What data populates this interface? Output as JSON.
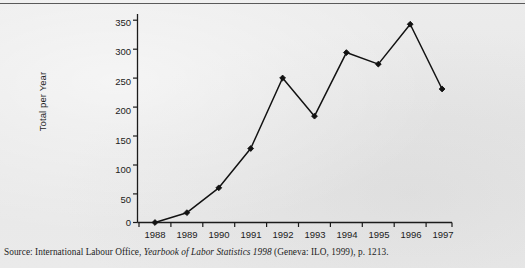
{
  "figure": {
    "source_prefix": "Source: International Labour Office, ",
    "source_italic": "Yearbook of Labor Statistics 1998",
    "source_suffix": " (Geneva: ILO, 1999), p. 1213."
  },
  "chart_data": {
    "type": "line",
    "title": "",
    "xlabel": "",
    "ylabel": "Total per Year",
    "categories": [
      "1988",
      "1989",
      "1990",
      "1991",
      "1992",
      "1993",
      "1994",
      "1995",
      "1996",
      "1997"
    ],
    "x": [
      1988,
      1989,
      1990,
      1991,
      1992,
      1993,
      1994,
      1995,
      1996,
      1997
    ],
    "values": [
      0,
      17,
      60,
      128,
      250,
      184,
      294,
      274,
      343,
      231
    ],
    "series": [
      {
        "name": "Total per Year",
        "values": [
          0,
          17,
          60,
          128,
          250,
          184,
          294,
          274,
          343,
          231
        ]
      }
    ],
    "ylim": [
      0,
      350
    ],
    "yticks": [
      0,
      50,
      100,
      150,
      200,
      250,
      300,
      350
    ],
    "ytick_labels": [
      "0",
      "50",
      "100",
      "150",
      "200",
      "250",
      "300",
      "350"
    ],
    "xtick_labels": [
      "1988",
      "1989",
      "1990",
      "1991",
      "1992",
      "1993",
      "1994",
      "1995",
      "1996",
      "1997"
    ],
    "grid": false,
    "legend": false,
    "legend_position": "none",
    "marker": "diamond",
    "line_color": "#121212",
    "marker_color": "#121212"
  }
}
